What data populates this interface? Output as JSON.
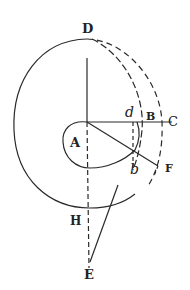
{
  "diagram": {
    "type": "geometric-figure",
    "labels": {
      "D": "D",
      "A": "A",
      "d": "d",
      "B": "B",
      "C": "C",
      "b": "b",
      "F": "F",
      "H": "H",
      "E": "E"
    },
    "colors": {
      "ink": "#222222",
      "paper": "#ffffff"
    }
  }
}
